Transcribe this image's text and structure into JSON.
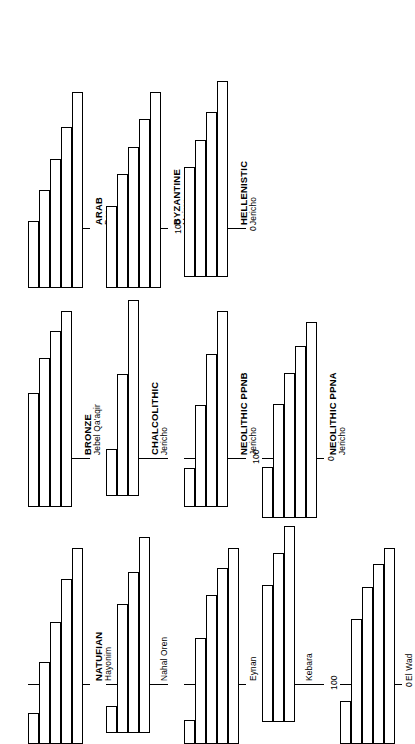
{
  "figure": {
    "axis": {
      "min_label": "0",
      "max_label": "100",
      "ymin": 0,
      "ymax": 100
    }
  },
  "chart_data": {
    "type": "bar",
    "title": "",
    "subtitle": "",
    "xlabel": "",
    "ylabel": "",
    "ylim": [
      0,
      100
    ],
    "grid": false,
    "legend": null,
    "orientation": "rotated-90-ccw",
    "note": "Eleven survivorship / age-class histograms for archaeological skeletal samples. Each panel plots percentage (0-100) on a shared axis; bars decline from left to right across successive age classes.",
    "panels": [
      {
        "id": "natufian-hayonim",
        "period": "NATUFIAN",
        "site": "Hayonim",
        "column": 1,
        "categories": [
          "1",
          "2",
          "3",
          "4",
          "5"
        ],
        "values": [
          16,
          42,
          62,
          84,
          100
        ]
      },
      {
        "id": "natufian-nahal-oren",
        "period": "",
        "site": "Nahal Oren",
        "column": 1,
        "categories": [
          "1",
          "2",
          "3",
          "4"
        ],
        "values": [
          14,
          66,
          82,
          100
        ]
      },
      {
        "id": "natufian-eynan",
        "period": "",
        "site": "Eynan",
        "column": 1,
        "categories": [
          "1",
          "2",
          "3",
          "4",
          "5"
        ],
        "values": [
          12,
          54,
          76,
          90,
          100
        ]
      },
      {
        "id": "natufian-kebara",
        "period": "",
        "site": "Kebara",
        "column": 1,
        "categories": [
          "1",
          "2",
          "3"
        ],
        "values": [
          70,
          86,
          100
        ]
      },
      {
        "id": "natufian-el-wad",
        "period": "",
        "site": "El Wad",
        "column": 1,
        "categories": [
          "1",
          "2",
          "3",
          "4",
          "5"
        ],
        "values": [
          22,
          64,
          80,
          92,
          100
        ]
      },
      {
        "id": "bronze-jebel-qaaqir",
        "period": "BRONZE",
        "site": "Jebel Qa'aqir",
        "column": 2,
        "categories": [
          "1",
          "2",
          "3",
          "4"
        ],
        "values": [
          58,
          76,
          90,
          100
        ]
      },
      {
        "id": "chalcolithic-jericho",
        "period": "CHALCOLITHIC",
        "site": "Jericho",
        "column": 2,
        "categories": [
          "1",
          "2",
          "3"
        ],
        "values": [
          24,
          62,
          100
        ]
      },
      {
        "id": "neolithic-ppnb-jericho",
        "period": "NEOLITHIC PPNB",
        "site": "Jericho",
        "column": 2,
        "categories": [
          "1",
          "2",
          "3",
          "4"
        ],
        "values": [
          20,
          52,
          78,
          100
        ]
      },
      {
        "id": "neolithic-ppna-jericho",
        "period": "NEOLITHIC PPNA",
        "site": "Jericho",
        "column": 2,
        "categories": [
          "1",
          "2",
          "3",
          "4",
          "5"
        ],
        "values": [
          26,
          58,
          74,
          88,
          100
        ]
      },
      {
        "id": "arab-dor",
        "period": "ARAB",
        "site": "Dor",
        "column": 3,
        "categories": [
          "1",
          "2",
          "3",
          "4",
          "5"
        ],
        "values": [
          34,
          50,
          66,
          82,
          100
        ]
      },
      {
        "id": "byzantine-meiron",
        "period": "BYZANTINE",
        "site": "Meiron",
        "column": 3,
        "categories": [
          "1",
          "2",
          "3",
          "4",
          "5"
        ],
        "values": [
          42,
          58,
          72,
          86,
          100
        ]
      },
      {
        "id": "hellenistic-jericho",
        "period": "HELLENISTIC",
        "site": "Jericho",
        "column": 3,
        "categories": [
          "1",
          "2",
          "3",
          "4"
        ],
        "values": [
          56,
          70,
          84,
          100
        ]
      }
    ]
  }
}
